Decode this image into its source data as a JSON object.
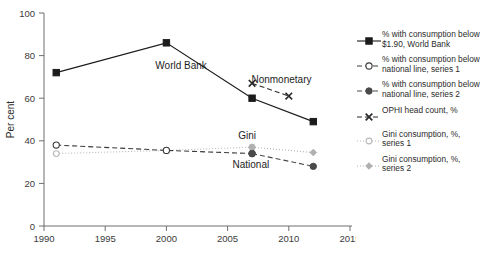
{
  "chart_data": {
    "type": "line",
    "title": "",
    "xlabel": "",
    "ylabel": "Per cent",
    "xlim": [
      1990,
      2015
    ],
    "ylim": [
      0,
      100
    ],
    "grid": false,
    "legend_position": "right",
    "x_ticks": [
      "1990",
      "1995",
      "2000",
      "2005",
      "2010",
      "2015"
    ],
    "y_ticks": [
      "0",
      "20",
      "40",
      "60",
      "80",
      "100"
    ],
    "series": [
      {
        "name": "% with consumption below $1.90, World Bank",
        "marker": "filled-square",
        "linestyle": "solid",
        "color": "#1c1c1c",
        "x": [
          1991,
          2000,
          2007,
          2012
        ],
        "values": [
          72,
          86,
          60,
          49
        ]
      },
      {
        "name": "% with consumption below national line, series 1",
        "marker": "open-circle",
        "linestyle": "dashed",
        "color": "#3a3a3a",
        "x": [
          1991,
          2000,
          2007
        ],
        "values": [
          38,
          35.5,
          34
        ]
      },
      {
        "name": "% with consumption below national line, series 2",
        "marker": "filled-circle",
        "linestyle": "dashed",
        "color": "#4a4a4a",
        "x": [
          2007,
          2012
        ],
        "values": [
          34,
          28
        ]
      },
      {
        "name": "OPHI head count, %",
        "marker": "x-cross",
        "linestyle": "dashed",
        "color": "#2b2b2b",
        "x": [
          2007,
          2010
        ],
        "values": [
          67,
          61
        ]
      },
      {
        "name": "Gini consumption, %, series 1",
        "marker": "open-circle-light",
        "linestyle": "dotted",
        "color": "#b8b8b8",
        "x": [
          1991,
          2000,
          2007
        ],
        "values": [
          34,
          35.5,
          37
        ]
      },
      {
        "name": "Gini consumption, %, series 2",
        "marker": "filled-diamond-light",
        "linestyle": "dotted",
        "color": "#b0b0b0",
        "x": [
          2007,
          2012
        ],
        "values": [
          37,
          34.5
        ]
      }
    ],
    "annotations": [
      {
        "text": "World Bank",
        "x": 2001.2,
        "y": 73.5
      },
      {
        "text": "Nonmonetary",
        "x": 2009.4,
        "y": 67
      },
      {
        "text": "Gini",
        "x": 2006.6,
        "y": 41
      },
      {
        "text": "National",
        "x": 2006.9,
        "y": 27
      }
    ]
  },
  "axis": {
    "ylabel": "Per cent",
    "y_tick_0": "0",
    "y_tick_20": "20",
    "y_tick_40": "40",
    "y_tick_60": "60",
    "y_tick_80": "80",
    "y_tick_100": "100",
    "x_tick_1990": "1990",
    "x_tick_1995": "1995",
    "x_tick_2000": "2000",
    "x_tick_2005": "2005",
    "x_tick_2010": "2010",
    "x_tick_2015": "2015"
  },
  "annotations": {
    "world_bank": "World Bank",
    "nonmonetary": "Nonmonetary",
    "gini": "Gini",
    "national": "National"
  },
  "legend": {
    "items": [
      {
        "label": "% with consumption below\n$1.90, World Bank",
        "marker": "filled-square-solid-line"
      },
      {
        "label": "% with consumption below\nnational line, series 1",
        "marker": "open-circle-dashed-line"
      },
      {
        "label": "% with consumption below\nnational line, series 2",
        "marker": "filled-circle-dashed-line"
      },
      {
        "label": "OPHI head count, %",
        "marker": "x-cross-dashed-line"
      },
      {
        "label": "Gini consumption, %,\nseries 1",
        "marker": "open-circle-light-dotted-line"
      },
      {
        "label": "Gini consumption, %,\nseries 2",
        "marker": "filled-diamond-light-dotted-line"
      }
    ]
  },
  "caption": {
    "text": ""
  },
  "colors": {
    "primary": "#1c1c1c",
    "secondary": "#4a4a4a",
    "light": "#b8b8b8",
    "axis": "#6e6e6e",
    "background": "#ffffff"
  }
}
